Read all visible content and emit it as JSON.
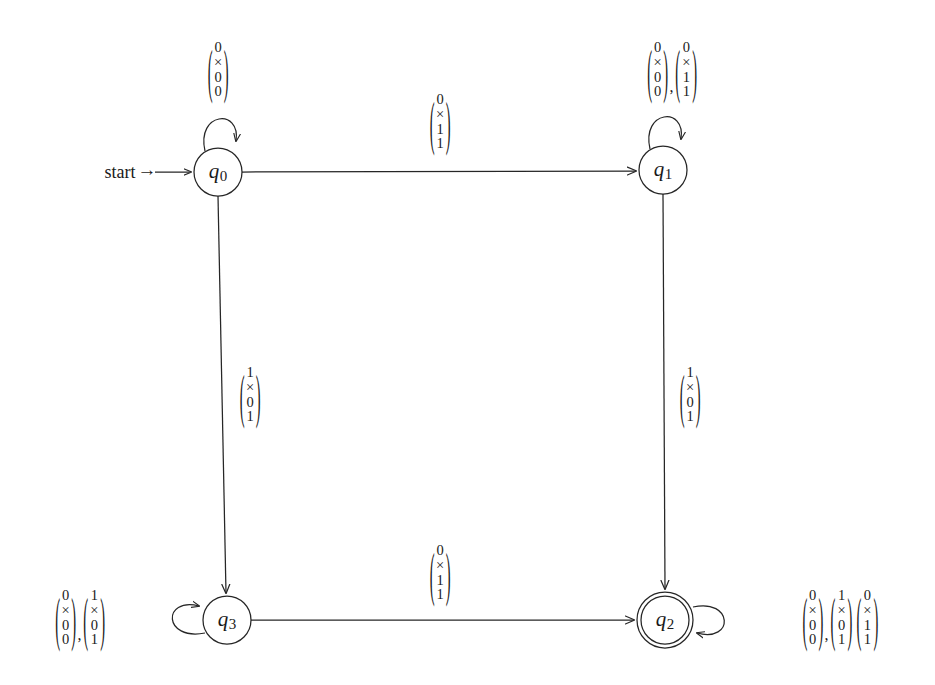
{
  "diagram": {
    "start_label": "start",
    "stroke_color": "#262626",
    "background_color": "#ffffff",
    "states": [
      {
        "id": "q0",
        "name": "q",
        "sub": "0",
        "accepting": false,
        "start": true,
        "cx": 218,
        "cy": 172,
        "r": 24
      },
      {
        "id": "q1",
        "name": "q",
        "sub": "1",
        "accepting": false,
        "start": false,
        "cx": 663,
        "cy": 170,
        "r": 24
      },
      {
        "id": "q3",
        "name": "q",
        "sub": "3",
        "accepting": false,
        "start": false,
        "cx": 227,
        "cy": 620,
        "r": 24
      },
      {
        "id": "q2",
        "name": "q",
        "sub": "2",
        "accepting": true,
        "start": false,
        "cx": 665,
        "cy": 620,
        "r": 24
      }
    ],
    "transitions": [
      {
        "id": "q0-self",
        "from": "q0",
        "to": "q0",
        "kind": "self-loop-top",
        "label_x": 218,
        "label_y": 70,
        "vectors": [
          [
            "0",
            "×",
            "0",
            "0"
          ]
        ]
      },
      {
        "id": "q0-q1",
        "from": "q0",
        "to": "q1",
        "kind": "edge-horizontal",
        "label_x": 440,
        "label_y": 122,
        "vectors": [
          [
            "0",
            "×",
            "1",
            "1"
          ]
        ]
      },
      {
        "id": "q1-self",
        "from": "q1",
        "to": "q1",
        "kind": "self-loop-top",
        "label_x": 672,
        "label_y": 70,
        "vectors": [
          [
            "0",
            "×",
            "0",
            "0"
          ],
          [
            "0",
            "×",
            "1",
            "1"
          ]
        ]
      },
      {
        "id": "q0-q3",
        "from": "q0",
        "to": "q3",
        "kind": "edge-vertical",
        "label_x": 250,
        "label_y": 395,
        "vectors": [
          [
            "1",
            "×",
            "0",
            "1"
          ]
        ]
      },
      {
        "id": "q1-q2",
        "from": "q1",
        "to": "q2",
        "kind": "edge-vertical",
        "label_x": 690,
        "label_y": 395,
        "vectors": [
          [
            "1",
            "×",
            "0",
            "1"
          ]
        ]
      },
      {
        "id": "q3-self",
        "from": "q3",
        "to": "q3",
        "kind": "self-loop-left",
        "label_x": 80,
        "label_y": 618,
        "vectors": [
          [
            "0",
            "×",
            "0",
            "0"
          ],
          [
            "1",
            "×",
            "0",
            "1"
          ]
        ]
      },
      {
        "id": "q3-q2",
        "from": "q3",
        "to": "q2",
        "kind": "edge-horizontal",
        "label_x": 440,
        "label_y": 573,
        "vectors": [
          [
            "0",
            "×",
            "1",
            "1"
          ]
        ]
      },
      {
        "id": "q2-self",
        "from": "q2",
        "to": "q2",
        "kind": "self-loop-right",
        "label_x": 840,
        "label_y": 618,
        "vectors": [
          [
            "0",
            "×",
            "0",
            "0"
          ],
          [
            "1",
            "×",
            "0",
            "1"
          ],
          [
            "0",
            "×",
            "1",
            "1"
          ]
        ],
        "comma_after": [
          0
        ]
      }
    ]
  }
}
